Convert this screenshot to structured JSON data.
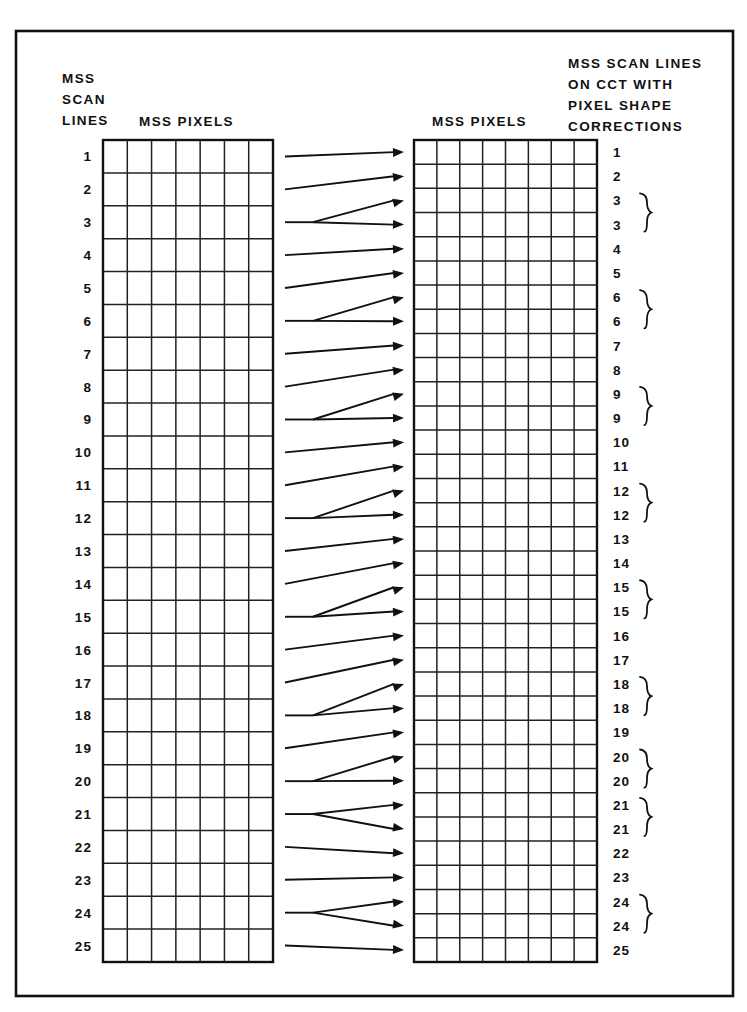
{
  "figure": {
    "background_color": "#ffffff",
    "ink_color": "#111111"
  },
  "frame": {
    "x": 16,
    "y": 31,
    "width": 717,
    "height": 965
  },
  "headers": {
    "left_block": {
      "lines": [
        "MSS",
        "SCAN",
        "LINES"
      ],
      "x": 62,
      "y_start": 83,
      "line_height": 21
    },
    "left_pixels_label": {
      "text": "MSS  PIXELS",
      "x": 139,
      "y": 126
    },
    "right_pixels_label": {
      "text": "MSS  PIXELS",
      "x": 432,
      "y": 126
    },
    "right_block": {
      "lines": [
        "MSS SCAN LINES",
        "ON CCT WITH",
        "PIXEL SHAPE",
        "CORRECTIONS"
      ],
      "x": 568,
      "y_start": 68,
      "line_height": 21
    }
  },
  "left_grid": {
    "x": 103,
    "y": 140,
    "width": 170,
    "height": 822,
    "columns": 7,
    "rows": 25,
    "label_x": 92,
    "row_labels": [
      "1",
      "2",
      "3",
      "4",
      "5",
      "6",
      "7",
      "8",
      "9",
      "10",
      "11",
      "12",
      "13",
      "14",
      "15",
      "16",
      "17",
      "18",
      "19",
      "20",
      "21",
      "22",
      "23",
      "24",
      "25"
    ]
  },
  "right_grid": {
    "x": 414,
    "y": 140,
    "width": 183,
    "height": 822,
    "columns": 8,
    "rows": 34,
    "label_x": 613,
    "brace_x": 641,
    "row_labels": [
      "1",
      "2",
      "3",
      "3",
      "4",
      "5",
      "6",
      "6",
      "7",
      "8",
      "9",
      "9",
      "10",
      "11",
      "12",
      "12",
      "13",
      "14",
      "15",
      "15",
      "16",
      "17",
      "18",
      "18",
      "19",
      "20",
      "20",
      "21",
      "21",
      "22",
      "23",
      "24",
      "24",
      "25"
    ],
    "brace_pairs": [
      [
        2,
        3
      ],
      [
        6,
        7
      ],
      [
        10,
        11
      ],
      [
        14,
        15
      ],
      [
        18,
        19
      ],
      [
        22,
        23
      ],
      [
        25,
        26
      ],
      [
        27,
        28
      ],
      [
        31,
        32
      ]
    ]
  },
  "arrows": {
    "start_x": 285,
    "fork_x": 313,
    "tip_x": 404,
    "mapping": [
      {
        "source_row": 1,
        "target_rows": [
          1
        ]
      },
      {
        "source_row": 2,
        "target_rows": [
          2
        ]
      },
      {
        "source_row": 3,
        "target_rows": [
          3,
          4
        ]
      },
      {
        "source_row": 4,
        "target_rows": [
          5
        ]
      },
      {
        "source_row": 5,
        "target_rows": [
          6
        ]
      },
      {
        "source_row": 6,
        "target_rows": [
          7,
          8
        ]
      },
      {
        "source_row": 7,
        "target_rows": [
          9
        ]
      },
      {
        "source_row": 8,
        "target_rows": [
          10
        ]
      },
      {
        "source_row": 9,
        "target_rows": [
          11,
          12
        ]
      },
      {
        "source_row": 10,
        "target_rows": [
          13
        ]
      },
      {
        "source_row": 11,
        "target_rows": [
          14
        ]
      },
      {
        "source_row": 12,
        "target_rows": [
          15,
          16
        ]
      },
      {
        "source_row": 13,
        "target_rows": [
          17
        ]
      },
      {
        "source_row": 14,
        "target_rows": [
          18
        ]
      },
      {
        "source_row": 15,
        "target_rows": [
          19,
          20
        ]
      },
      {
        "source_row": 16,
        "target_rows": [
          21
        ]
      },
      {
        "source_row": 17,
        "target_rows": [
          22
        ]
      },
      {
        "source_row": 18,
        "target_rows": [
          23,
          24
        ]
      },
      {
        "source_row": 19,
        "target_rows": [
          25
        ]
      },
      {
        "source_row": 20,
        "target_rows": [
          26,
          27
        ]
      },
      {
        "source_row": 21,
        "target_rows": [
          28,
          29
        ]
      },
      {
        "source_row": 22,
        "target_rows": [
          30
        ]
      },
      {
        "source_row": 23,
        "target_rows": [
          31
        ]
      },
      {
        "source_row": 24,
        "target_rows": [
          32,
          33
        ]
      },
      {
        "source_row": 25,
        "target_rows": [
          34
        ]
      }
    ]
  }
}
